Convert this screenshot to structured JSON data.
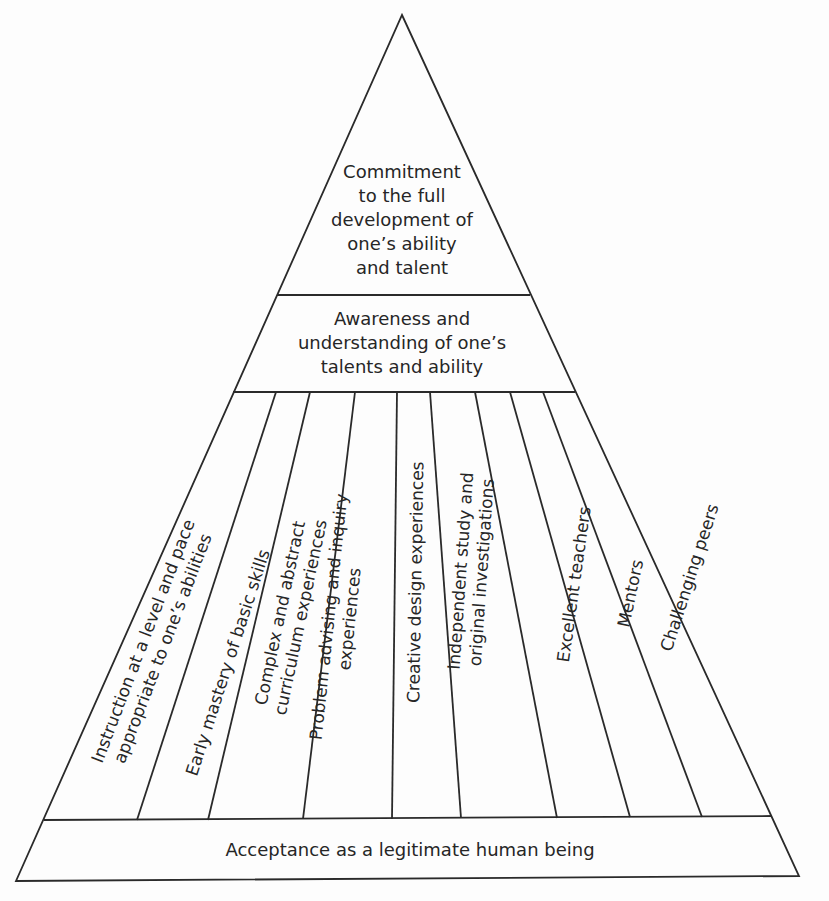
{
  "diagram": {
    "type": "pyramid",
    "levels": [
      {
        "id": "top",
        "lines": [
          "Commitment",
          "to the full",
          "development of",
          "one’s ability",
          "and talent"
        ]
      },
      {
        "id": "second",
        "lines": [
          "Awareness and",
          "understanding of one’s",
          "talents and ability"
        ]
      },
      {
        "id": "middle",
        "columns": [
          {
            "lines": [
              "Instruction at a level and pace",
              "appropriate to one’s abilities"
            ]
          },
          {
            "lines": [
              "Early mastery of basic skills"
            ]
          },
          {
            "lines": [
              "Complex and abstract",
              "curriculum experiences"
            ]
          },
          {
            "lines": [
              "Problem advising and inquiry",
              "experiences"
            ]
          },
          {
            "lines": [
              "Creative design experiences"
            ]
          },
          {
            "lines": [
              "Independent study and",
              "original investigations"
            ]
          },
          {
            "lines": [
              "Excellent teachers"
            ]
          },
          {
            "lines": [
              "Mentors"
            ]
          },
          {
            "lines": [
              "Challenging peers"
            ]
          }
        ]
      },
      {
        "id": "base",
        "lines": [
          "Acceptance as a legitimate human being"
        ]
      }
    ],
    "colors": {
      "stroke": "#2a2a2a",
      "background": "#fdfdfd",
      "text": "#262626"
    }
  }
}
